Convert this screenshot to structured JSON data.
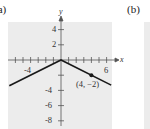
{
  "panels": {
    "a": {
      "label": "(a)"
    },
    "b": {
      "label": "(b)"
    }
  },
  "colors": {
    "panel_bg": "#ececec",
    "line": "#1a1a1a",
    "axis": "#555555"
  },
  "chart_data": {
    "type": "line",
    "title": "",
    "xlabel": "x",
    "ylabel": "y",
    "xlim": [
      -7,
      7
    ],
    "ylim": [
      -9,
      5
    ],
    "grid": false,
    "x_tick_labels": [
      "-4",
      "6"
    ],
    "y_tick_labels": [
      "4",
      "2",
      "-4",
      "-6",
      "-8"
    ],
    "series": [
      {
        "name": "f(x)",
        "x": [
          -6.8,
          0,
          6.6
        ],
        "y": [
          -3.4,
          0,
          -3.3
        ]
      }
    ],
    "points": [
      {
        "x": 4,
        "y": -2,
        "label": "(4, −2)"
      }
    ],
    "annotations": [
      "(4, −2)"
    ]
  }
}
